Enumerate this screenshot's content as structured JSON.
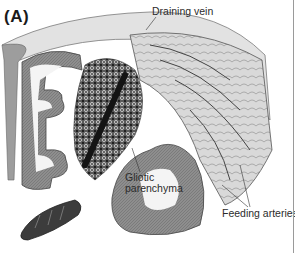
{
  "figure": {
    "panel_label": "(A)",
    "annotations": {
      "draining_vein": "Draining vein",
      "gliotic_line1": "Gliotic",
      "gliotic_line2": "parenchyma",
      "feeding_arteries": "Feeding arteries"
    },
    "colors": {
      "background": "#ffffff",
      "cortex_gray": "#8c8c8c",
      "white_matter": "#f4f4f4",
      "nidus_dark": "#2a2a2a",
      "surface_vessels": "#cfcfcf",
      "text": "#2b2b2b"
    }
  }
}
